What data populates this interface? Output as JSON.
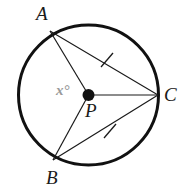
{
  "figure": {
    "type": "circle-geometry-diagram",
    "labels": {
      "vertex_a": "A",
      "vertex_b": "B",
      "vertex_c": "C",
      "center_p": "P",
      "angle_x": "x°"
    },
    "colors": {
      "stroke": "#1a1a1a",
      "circle_stroke": "#111111",
      "background": "#ffffff",
      "angle_label": "#9a9a9a",
      "center_dot": "#111111"
    },
    "geometry": {
      "circle": {
        "cx": 88.5,
        "cy": 95,
        "r": 70,
        "stroke_width": 3
      },
      "center_dot_radius": 6,
      "points": {
        "A": {
          "x": 50,
          "y": 31
        },
        "B": {
          "x": 53,
          "y": 160
        },
        "C": {
          "x": 158,
          "y": 95
        },
        "P": {
          "x": 88.5,
          "y": 95
        }
      },
      "segments": [
        {
          "name": "radius-PA",
          "from": "P",
          "to": "A"
        },
        {
          "name": "radius-PB",
          "from": "P",
          "to": "B"
        },
        {
          "name": "radius-PC",
          "from": "P",
          "to": "C"
        },
        {
          "name": "chord-AC",
          "from": "A",
          "to": "C"
        },
        {
          "name": "chord-BC",
          "from": "B",
          "to": "C"
        }
      ],
      "tick_marks": [
        {
          "name": "tick-chord-AC",
          "x": 107,
          "y": 60
        },
        {
          "name": "tick-chord-BC",
          "x": 110,
          "y": 131
        }
      ]
    }
  }
}
